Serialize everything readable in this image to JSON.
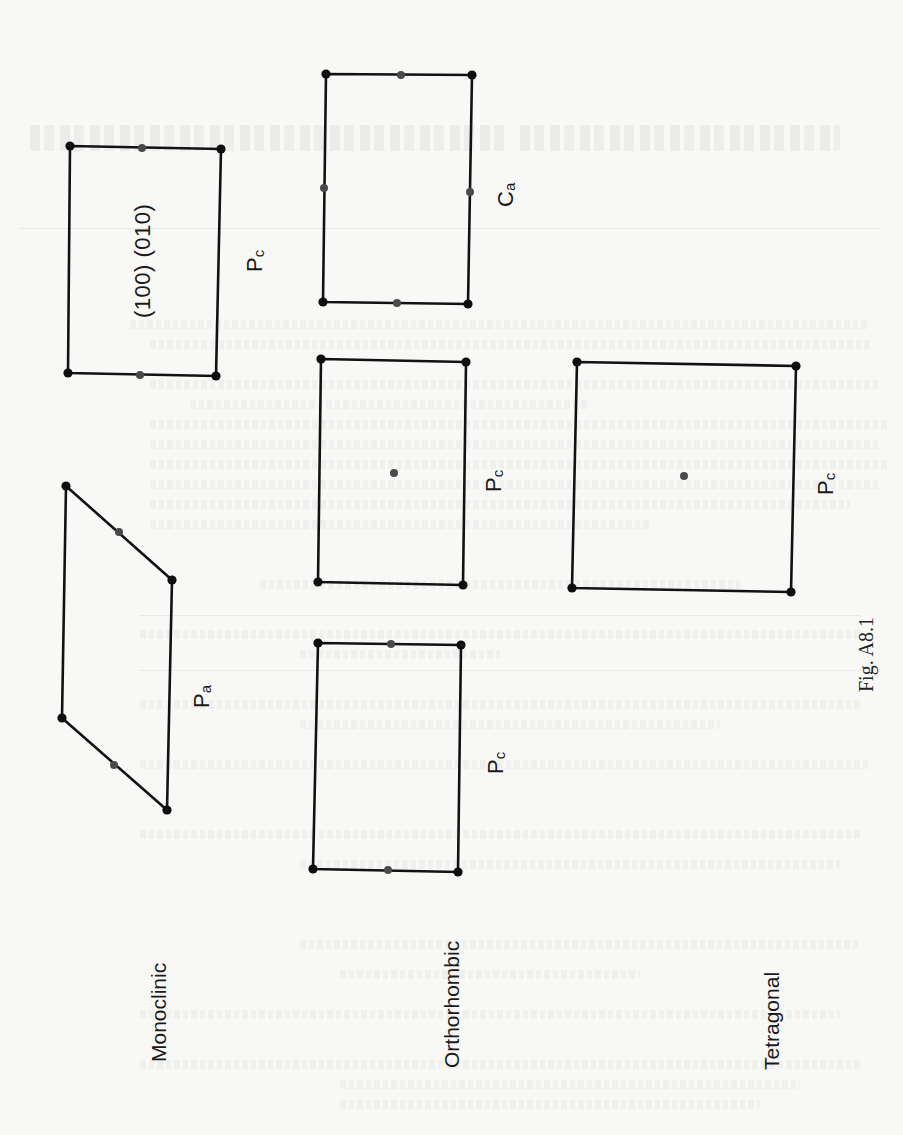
{
  "figure": {
    "caption": "Fig. A8.1",
    "orientation": "rotated 90° counter-clockwise",
    "colors": {
      "background": "#f8f8f7",
      "line": "#121212",
      "corner_point": "#0e0e0e",
      "centering_point": "#4a4a4a"
    }
  },
  "systems": [
    {
      "name": "Monoclinic",
      "cells": [
        {
          "symbol": "P",
          "subscript": "a",
          "shape": "parallelogram",
          "points": "edge-midpoints on slanted edges"
        },
        {
          "symbol": "P",
          "subscript": "c",
          "shape": "rectangle",
          "planes": "(100) (010)",
          "points": "edge-midpoints on top and bottom edges"
        }
      ]
    },
    {
      "name": "Orthorhombic",
      "cells": [
        {
          "symbol": "P",
          "subscript": "c",
          "shape": "rectangle",
          "points": "edge-midpoints on top and bottom edges"
        },
        {
          "symbol": "P",
          "subscript": "c",
          "shape": "rectangle",
          "points": "face-centre point"
        },
        {
          "symbol": "C",
          "subscript": "a",
          "shape": "rectangle",
          "points": "edge-midpoints on all four edges"
        }
      ]
    },
    {
      "name": "Tetragonal",
      "cells": [
        {
          "symbol": "P",
          "subscript": "c",
          "shape": "square",
          "points": "face-centre point"
        }
      ]
    }
  ],
  "labels": {
    "monoclinic": "Monoclinic",
    "orthorhombic": "Orthorhombic",
    "tetragonal": "Tetragonal",
    "mono_pa_symbol": "P",
    "mono_pa_sub": "a",
    "mono_pc_symbol": "P",
    "mono_pc_sub": "c",
    "mono_pc_planes": "(100) (010)",
    "ortho_lower_pc_symbol": "P",
    "ortho_lower_pc_sub": "c",
    "ortho_mid_pc_symbol": "P",
    "ortho_mid_pc_sub": "c",
    "ortho_ca_symbol": "C",
    "ortho_ca_sub": "a",
    "tetra_pc_symbol": "P",
    "tetra_pc_sub": "c",
    "caption": "Fig. A8.1"
  }
}
